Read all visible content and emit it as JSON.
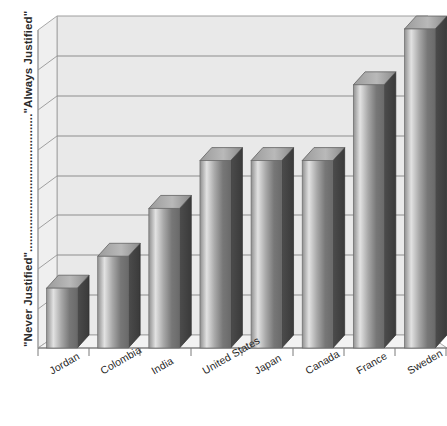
{
  "chart_data": {
    "type": "bar",
    "title": "",
    "subtitle": "",
    "xlabel": "",
    "ylabel": "\"Never Justified\"..........................................\"Always Justified\"",
    "ylabel_low": "\"Never Justified\"",
    "ylabel_high": "\"Always Justified\"",
    "categories": [
      "Jordan",
      "Colombia",
      "India",
      "United States",
      "Japan",
      "Canada",
      "France",
      "Sweden"
    ],
    "values": [
      1.5,
      2.3,
      3.5,
      4.7,
      4.7,
      4.7,
      6.6,
      8.0
    ],
    "ylim": [
      0,
      8
    ],
    "yticks": [
      0,
      1,
      2,
      3,
      4,
      5,
      6,
      7,
      8
    ],
    "ytick_labels": [
      "",
      "",
      "",
      "",
      "",
      "",
      "",
      "",
      ""
    ],
    "grid": true,
    "grid_axis": "y",
    "legend": false,
    "legend_position": "none",
    "style": "3d-column",
    "bar_color": "#9a9a9a",
    "bar_color_dark": "#4a4a4a",
    "bar_color_light": "#d8d8d8",
    "plot_background": "#e8e8e8",
    "gridline_color": "#8d8d8d",
    "axis_color": "#7a7a7a"
  },
  "axes": {
    "y_title": "\"Never Justified\"..........................................\"Always Justified\""
  }
}
